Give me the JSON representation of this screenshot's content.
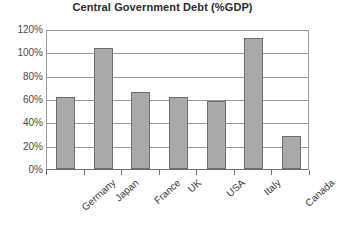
{
  "chart_data": {
    "type": "bar",
    "title": "Central Government Debt (%GDP)",
    "xlabel": "",
    "ylabel": "",
    "categories": [
      "Germany",
      "Japan",
      "France",
      "UK",
      "USA",
      "Italy",
      "Canada"
    ],
    "values": [
      62,
      104,
      66,
      62,
      58,
      112,
      28
    ],
    "ylim": [
      0,
      120
    ],
    "ytick_labels": [
      "120%",
      "100%",
      "80%",
      "60%",
      "40%",
      "20%",
      "0%"
    ],
    "ytick_values": [
      120,
      100,
      80,
      60,
      40,
      20,
      0
    ],
    "grid": true,
    "legend": false,
    "series_name": "Central Government Debt",
    "value_suffix": "%",
    "colors": {
      "bar_fill": "#a9a9a9",
      "bar_border": "#6d6d6d",
      "gridline": "#9a9a9a",
      "axis": "#6f6f6f",
      "text": "#3a3a3a",
      "title": "#2b2b2b",
      "background": "#ffffff"
    }
  }
}
